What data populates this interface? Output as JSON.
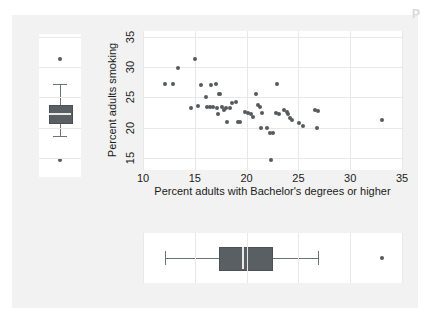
{
  "figure": {
    "corner_glyph": "P",
    "background_color": "#f2f2f2",
    "panel_color": "#ffffff",
    "mark_color": "#555a5e"
  },
  "chart_data": {
    "type": "scatter",
    "title": "",
    "xlabel": "Percent adults with Bachelor's degrees or higher",
    "ylabel": "Percent adults smoking",
    "xlim": [
      10,
      35
    ],
    "ylim": [
      13,
      36
    ],
    "xticks": [
      10,
      15,
      20,
      25,
      30,
      35
    ],
    "yticks": [
      15,
      20,
      25,
      30,
      35
    ],
    "xtick_labels": [
      "10",
      "15",
      "20",
      "25",
      "30",
      "35"
    ],
    "ytick_labels": [
      "15",
      "20",
      "25",
      "30",
      "35"
    ],
    "grid": true,
    "legend": "none",
    "points": [
      [
        12.1,
        27.2
      ],
      [
        12.9,
        27.2
      ],
      [
        13.4,
        29.8
      ],
      [
        15.0,
        31.4
      ],
      [
        14.6,
        23.3
      ],
      [
        15.3,
        23.6
      ],
      [
        15.6,
        27.1
      ],
      [
        16.1,
        25.0
      ],
      [
        16.2,
        23.5
      ],
      [
        16.5,
        23.5
      ],
      [
        16.8,
        23.4
      ],
      [
        17.0,
        27.3
      ],
      [
        16.6,
        27.1
      ],
      [
        17.1,
        23.2
      ],
      [
        17.2,
        22.2
      ],
      [
        17.3,
        25.5
      ],
      [
        17.4,
        25.5
      ],
      [
        17.6,
        23.4
      ],
      [
        17.8,
        22.9
      ],
      [
        18.0,
        23.2
      ],
      [
        18.1,
        21.0
      ],
      [
        18.4,
        23.3
      ],
      [
        18.6,
        24.1
      ],
      [
        19.0,
        24.2
      ],
      [
        19.2,
        21.0
      ],
      [
        19.4,
        21.0
      ],
      [
        19.8,
        22.6
      ],
      [
        20.1,
        22.5
      ],
      [
        20.4,
        22.3
      ],
      [
        20.6,
        21.7
      ],
      [
        20.9,
        25.6
      ],
      [
        21.1,
        23.7
      ],
      [
        21.3,
        23.5
      ],
      [
        21.5,
        22.5
      ],
      [
        21.4,
        20.0
      ],
      [
        22.0,
        19.9
      ],
      [
        22.3,
        19.2
      ],
      [
        22.5,
        19.2
      ],
      [
        22.4,
        14.6
      ],
      [
        22.9,
        27.3
      ],
      [
        22.8,
        22.4
      ],
      [
        23.1,
        22.3
      ],
      [
        23.6,
        22.9
      ],
      [
        23.9,
        22.6
      ],
      [
        24.0,
        22.2
      ],
      [
        24.2,
        21.6
      ],
      [
        24.4,
        21.2
      ],
      [
        25.1,
        20.8
      ],
      [
        25.4,
        20.3
      ],
      [
        26.6,
        22.9
      ],
      [
        26.9,
        22.7
      ],
      [
        26.8,
        19.9
      ],
      [
        33.1,
        21.2
      ]
    ],
    "marginal_box_y": {
      "axis": "vertical",
      "variable": "Percent adults smoking",
      "min_whisker": 18.7,
      "q1": 21.0,
      "median": 22.5,
      "q3": 23.7,
      "max_whisker": 27.3,
      "outliers": [
        31.4,
        14.6
      ]
    },
    "marginal_box_x": {
      "axis": "horizontal",
      "variable": "Percent adults with Bachelor's degrees or higher",
      "min_whisker": 12.1,
      "q1": 17.3,
      "median": 19.6,
      "q3": 22.4,
      "max_whisker": 26.9,
      "outliers": [
        33.1
      ]
    }
  }
}
